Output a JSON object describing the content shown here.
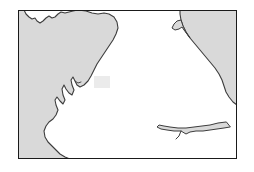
{
  "figure": {
    "kind": "coastline-map",
    "title": "",
    "caption": "",
    "labels": [],
    "frame": {
      "x": 18,
      "y": 10,
      "width": 219,
      "height": 149,
      "border_color": "#1a1a1a",
      "border_width": 1
    },
    "colors": {
      "sea_fill": "#d9d9d9",
      "land_fill": "#ffffff",
      "coastline_stroke": "#3c3c3c",
      "frame_stroke": "#1a1a1a",
      "marker_fill": "#ebebeb",
      "page_background": "#ffffff"
    },
    "marker": {
      "name": "area-highlight-box",
      "label": "",
      "x": 76,
      "y": 66,
      "width": 16,
      "height": 12,
      "fill": "#ebebeb"
    },
    "land_outline": {
      "note": "Coastline polyline in frame-local coordinates (0,0 top-left of frame, 219x149).",
      "path": "M 4 0 L 4 5 L 7 8 L 9 12 L 13 14 L 17 13 L 20 16 L 24 14 L 27 10 L 30 8 L 33 10 L 36 9 L 39 5 L 42 4 L 46 5 L 50 3 L 54 1 L 58 0 L 66 1 L 72 3 L 78 3 L 84 2 L 90 3 L 96 6 L 99 11 L 100 16 L 98 22 L 96 28 L 92 34 L 88 40 L 84 46 L 80 52 L 76 58 L 73 64 L 70 70 L 66 74 L 62 76 L 58 74 L 56 70 L 54 66 L 52 69 L 53 74 L 55 79 L 53 84 L 50 82 L 47 78 L 45 74 L 43 78 L 44 84 L 46 89 L 44 93 L 41 90 L 38 86 L 36 89 L 37 94 L 39 99 L 37 104 L 34 108 L 30 111 L 27 115 L 25 120 L 26 126 L 29 131 L 33 135 L 37 139 L 41 143 L 45 146 L 50 148 L 56 149 L 66 149 L 76 149 L 86 149 L 96 149 L 106 149 L 116 149 L 126 149 L 136 149 L 146 149 L 156 149 L 166 149 L 176 149 L 186 149 L 196 149 L 206 149 L 216 149 L 219 149",
      "west_coast_points": "sequence of indented bays and headlands descending from the upper-left corner to the lower-left quadrant",
      "east_coast_points": "smooth convex bulge descending from upper-right, with a narrow estuary inlet in the lower-right quadrant"
    }
  }
}
